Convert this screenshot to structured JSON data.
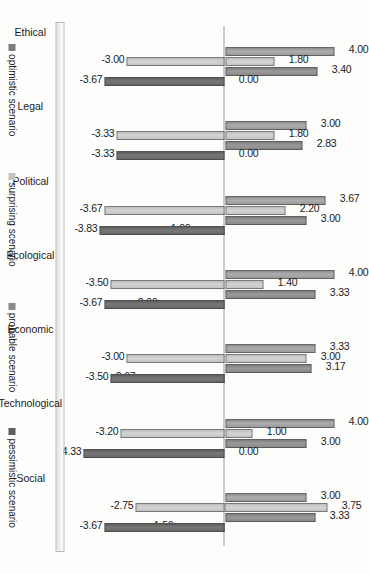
{
  "chart_data": {
    "type": "bar",
    "title": "",
    "xlabel": "",
    "ylabel": "",
    "ylim": [
      -5,
      5
    ],
    "grid": false,
    "orientation": "vertical-rotated-90",
    "legend_position": "bottom",
    "categories": [
      "Ethical",
      "Legal",
      "Political",
      "Ecological",
      "Economic",
      "Technological",
      "Social"
    ],
    "series": [
      {
        "name": "optimistic scenario",
        "color": "#9b9b9b",
        "values": [
          4.0,
          3.0,
          3.67,
          4.0,
          3.33,
          4.0,
          3.0
        ],
        "labels": [
          "4.00",
          "3.00",
          "3.67",
          "4.00",
          "3.33",
          "4.00",
          "3.00"
        ]
      },
      {
        "name": "surprising scenario",
        "color": "#c4c4c4",
        "values": [
          1.8,
          1.8,
          2.2,
          1.4,
          3.0,
          1.0,
          3.75
        ],
        "labels": [
          "1.80",
          "1.80",
          "2.20",
          "1.40",
          "3.00",
          "1.00",
          "3.75"
        ]
      },
      {
        "name": "probable scenario",
        "color": "#8a8a8a",
        "values": [
          3.4,
          2.83,
          3.0,
          3.33,
          3.17,
          3.0,
          3.33
        ],
        "labels": [
          "3.40",
          "2.83",
          "3.00",
          "3.33",
          "3.17",
          "3.00",
          "3.33"
        ]
      },
      {
        "name": "pessimistic scenario",
        "color": "#696969",
        "values": [
          0.0,
          0.0,
          -1.0,
          -2.0,
          -2.67,
          0.0,
          -1.5
        ],
        "labels": [
          "0.00",
          "0.00",
          "-1.00",
          "-2.00",
          "-2.67",
          "0.00",
          "-1.50"
        ]
      },
      {
        "name": "optimistic scenario negative",
        "color": "#c4c4c4",
        "values": [
          -3.0,
          -3.33,
          -3.67,
          -3.5,
          -3.0,
          -3.2,
          -2.75
        ],
        "labels": [
          "-3.00",
          "-3.33",
          "-3.67",
          "-3.50",
          "-3.00",
          "-3.20",
          "-2.75"
        ]
      },
      {
        "name": "probable scenario negative",
        "color": "#696969",
        "values": [
          -3.67,
          -3.33,
          -3.83,
          -3.67,
          -3.5,
          -4.33,
          -3.67
        ],
        "labels": [
          "-3.67",
          "-3.33",
          "-3.83",
          "-3.67",
          "-3.50",
          "-4.33",
          "-3.67"
        ]
      }
    ],
    "legend": [
      "optimistic scenario",
      "surprising scenario",
      "probable scenario",
      "pessimistic scenario"
    ],
    "legend_colors": [
      "#7d7d7d",
      "#c4c4c4",
      "#8a8a8a",
      "#5d5d5d"
    ]
  }
}
